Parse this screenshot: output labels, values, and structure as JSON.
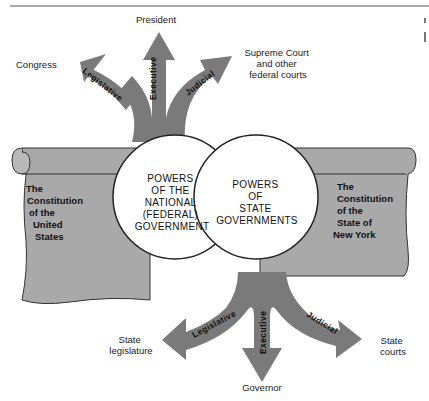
{
  "diagram": {
    "national": {
      "circle_lines": [
        "POWERS",
        "OF THE",
        "NATIONAL",
        "(FEDERAL)",
        "GOVERNMENT"
      ],
      "scroll_lines": [
        "The",
        "Constitution",
        "of the",
        "United",
        "States"
      ],
      "branches": {
        "legislative": {
          "arrow_label": "Legislative",
          "target": "Congress"
        },
        "executive": {
          "arrow_label": "Executive",
          "target": "President"
        },
        "judicial": {
          "arrow_label": "Judicial",
          "target_lines": [
            "Supreme Court",
            "and other",
            "federal courts"
          ]
        }
      }
    },
    "state": {
      "circle_lines": [
        "POWERS",
        "OF",
        "STATE",
        "GOVERNMENTS"
      ],
      "scroll_lines": [
        "The",
        "Constitution",
        "of the",
        "State of",
        "New York"
      ],
      "branches": {
        "legislative": {
          "arrow_label": "Legislative",
          "target_lines": [
            "State",
            "legislature"
          ]
        },
        "executive": {
          "arrow_label": "Executive",
          "target": "Governor"
        },
        "judicial": {
          "arrow_label": "Judicial",
          "target_lines": [
            "State",
            "courts"
          ]
        }
      }
    },
    "colors": {
      "arrow": "#7a7a7a",
      "scroll": "#a9a9a9",
      "outline": "#222222",
      "circle_fill": "#ffffff"
    }
  }
}
